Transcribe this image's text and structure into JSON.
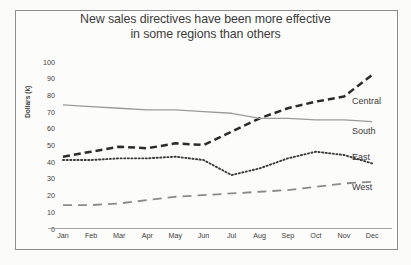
{
  "chart_data": {
    "type": "line",
    "title": "New sales directives have been more effective in some regions than others",
    "title_line1": "New sales directives have been more effective",
    "title_line2": "in some regions than others",
    "xlabel": "",
    "ylabel": "Dollars (k)",
    "categories": [
      "Jan",
      "Feb",
      "Mar",
      "Apr",
      "May",
      "Jun",
      "Jul",
      "Aug",
      "Sep",
      "Oct",
      "Nov",
      "Dec"
    ],
    "yticks": [
      0,
      10,
      20,
      30,
      40,
      50,
      60,
      70,
      80,
      90,
      100
    ],
    "ylim": [
      0,
      100
    ],
    "grid": false,
    "legend_position": "right-inline-labels",
    "series": [
      {
        "name": "Central",
        "style": "dashed",
        "color": "#2b2b2b",
        "values": [
          43,
          46,
          49,
          48,
          51,
          50,
          58,
          66,
          72,
          76,
          79,
          92
        ]
      },
      {
        "name": "South",
        "style": "solid",
        "color": "#9a9a9a",
        "values": [
          74,
          73,
          72,
          71,
          71,
          70,
          69,
          66,
          66,
          65,
          65,
          64
        ]
      },
      {
        "name": "East",
        "style": "dotted",
        "color": "#3a3a3a",
        "values": [
          41,
          41,
          42,
          42,
          43,
          41,
          32,
          36,
          42,
          46,
          44,
          39
        ]
      },
      {
        "name": "West",
        "style": "longdash",
        "color": "#8a8a8a",
        "values": [
          14,
          14,
          15,
          17,
          19,
          20,
          21,
          22,
          23,
          25,
          27,
          28
        ]
      }
    ]
  },
  "colors": {
    "background": "#fbfbf9",
    "border": "#8d8d8d",
    "axis": "#9a9a9a",
    "text": "#3c3c3c"
  }
}
